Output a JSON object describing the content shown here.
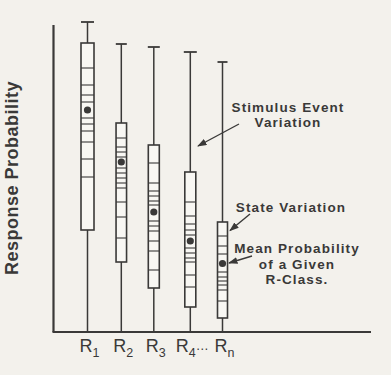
{
  "figure": {
    "bg": "#f3f1ec",
    "paper": "#f8f7f3",
    "ink": "#3a3938"
  },
  "chart_data": {
    "type": "boxplot",
    "title": "",
    "xlabel": "",
    "ylabel": "Response Probability",
    "y_axis_numeric": false,
    "grid": false,
    "axes": {
      "x_px": 53.5,
      "y_px": 332,
      "x_end_px": 371,
      "y_top_px": 25,
      "ylabel_cx": 18,
      "ylabel_cy": 178,
      "tick_label_y": 352
    },
    "boxes": [
      {
        "id": "r1",
        "label_base": "R",
        "label_sub": "1",
        "label_suffix": "",
        "x_px": 87.5,
        "cap_y_px": 22,
        "box_top_px": 43,
        "box_bottom_px": 230,
        "mean_y_px": 110,
        "mean_rel": 0.72,
        "box_width_px": 13,
        "cap_width_px": 13,
        "stripes_y_px": [
          68,
          85,
          95,
          102,
          118,
          124,
          131,
          142,
          159,
          177
        ]
      },
      {
        "id": "r2",
        "label_base": "R",
        "label_sub": "2",
        "label_suffix": "",
        "x_px": 121.3,
        "cap_y_px": 44,
        "box_top_px": 123,
        "box_bottom_px": 262,
        "mean_y_px": 162,
        "mean_rel": 0.55,
        "box_width_px": 10.5,
        "cap_width_px": 11,
        "stripes_y_px": [
          138,
          147,
          152,
          157,
          168,
          173,
          178,
          183,
          188,
          202,
          217,
          238
        ]
      },
      {
        "id": "r3",
        "label_base": "R",
        "label_sub": "3",
        "label_suffix": "",
        "x_px": 153.8,
        "cap_y_px": 47,
        "box_top_px": 145,
        "box_bottom_px": 288,
        "mean_y_px": 212,
        "mean_rel": 0.39,
        "box_width_px": 11,
        "cap_width_px": 12,
        "stripes_y_px": [
          163,
          183,
          191,
          196,
          201,
          205,
          221,
          226,
          231,
          241,
          251,
          270
        ]
      },
      {
        "id": "r4",
        "label_base": "R",
        "label_sub": "4",
        "label_suffix": "…",
        "x_px": 190.3,
        "cap_y_px": 52,
        "box_top_px": 172,
        "box_bottom_px": 307,
        "mean_y_px": 241,
        "mean_rel": 0.3,
        "box_width_px": 11,
        "cap_width_px": 13,
        "stripes_y_px": [
          202,
          216,
          224,
          230,
          235,
          248,
          253,
          258,
          262,
          275,
          287
        ]
      },
      {
        "id": "rn",
        "label_base": "R",
        "label_sub": "n",
        "label_suffix": "",
        "x_px": 222.5,
        "cap_y_px": 62,
        "box_top_px": 222,
        "box_bottom_px": 318,
        "mean_y_px": 263.5,
        "mean_rel": 0.22,
        "box_width_px": 10,
        "cap_width_px": 10,
        "stripes_y_px": [
          236,
          246,
          254,
          272,
          277,
          281,
          285,
          290,
          301
        ]
      }
    ],
    "annotations": [
      {
        "id": "stimulus-event-variation",
        "lines": [
          "Stimulus Event",
          "Variation"
        ],
        "cx": 288,
        "baseline_y": 112,
        "line_height": 15,
        "arrow": {
          "x1": 239,
          "y1": 124,
          "x2": 198,
          "y2": 146
        }
      },
      {
        "id": "state-variation",
        "lines": [
          "State Variation"
        ],
        "cx": 291,
        "baseline_y": 211.5,
        "line_height": 15,
        "arrow": {
          "x1": 250,
          "y1": 214,
          "x2": 230,
          "y2": 230.5
        }
      },
      {
        "id": "mean-probability-of-a-given-r-class",
        "lines": [
          "Mean Probability",
          "of a Given",
          "R-Class."
        ],
        "cx": 297,
        "baseline_y": 253,
        "line_height": 15.6,
        "arrow": {
          "x1": 252,
          "y1": 256,
          "x2": 229,
          "y2": 263
        }
      }
    ]
  }
}
